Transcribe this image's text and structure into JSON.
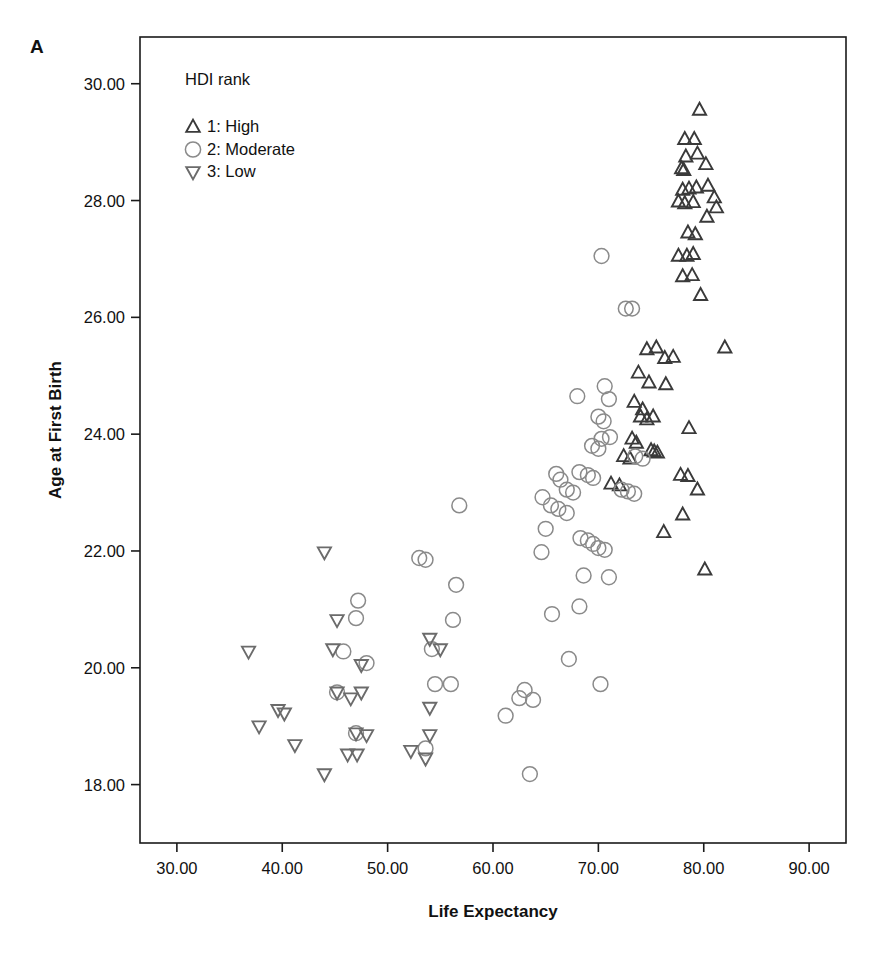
{
  "panel": {
    "label": "A"
  },
  "colors": {
    "high": "#3a3a3a",
    "moderate": "#8a8a8a",
    "low": "#6b6b6b",
    "frame": "#1a1a1a",
    "text": "#111111"
  },
  "legend": {
    "title": "HDI rank",
    "items": [
      {
        "symbol": "triangle-up",
        "label": "1: High"
      },
      {
        "symbol": "circle",
        "label": "2: Moderate"
      },
      {
        "symbol": "triangle-down",
        "label": "3: Low"
      }
    ]
  },
  "chart_data": {
    "type": "scatter",
    "title": "",
    "xlabel": "Life Expectancy",
    "ylabel": "Age at First Birth",
    "xlim": [
      26.5,
      93.5
    ],
    "ylim": [
      17.0,
      30.8
    ],
    "xticks": [
      30,
      40,
      50,
      60,
      70,
      80,
      90
    ],
    "xtick_labels": [
      "30.00",
      "40.00",
      "50.00",
      "60.00",
      "70.00",
      "80.00",
      "90.00"
    ],
    "yticks": [
      18,
      20,
      22,
      24,
      26,
      28,
      30
    ],
    "ytick_labels": [
      "18.00",
      "20.00",
      "22.00",
      "24.00",
      "26.00",
      "28.00",
      "30.00"
    ],
    "grid": false,
    "legend_position": "top-left-inside",
    "series": [
      {
        "name": "1: High",
        "symbol": "triangle-up",
        "color": "#3a3a3a",
        "points": [
          [
            79.6,
            29.55
          ],
          [
            78.2,
            29.05
          ],
          [
            79.1,
            29.05
          ],
          [
            78.3,
            28.75
          ],
          [
            79.4,
            28.8
          ],
          [
            80.2,
            28.62
          ],
          [
            77.9,
            28.55
          ],
          [
            78.1,
            28.52
          ],
          [
            78.0,
            28.18
          ],
          [
            78.6,
            28.2
          ],
          [
            79.3,
            28.22
          ],
          [
            80.4,
            28.25
          ],
          [
            81.0,
            28.05
          ],
          [
            77.6,
            27.98
          ],
          [
            78.2,
            27.95
          ],
          [
            79.0,
            27.97
          ],
          [
            80.3,
            27.72
          ],
          [
            81.2,
            27.88
          ],
          [
            78.5,
            27.45
          ],
          [
            79.2,
            27.42
          ],
          [
            77.6,
            27.05
          ],
          [
            78.4,
            27.05
          ],
          [
            79.0,
            27.08
          ],
          [
            78.0,
            26.7
          ],
          [
            78.9,
            26.72
          ],
          [
            79.7,
            26.38
          ],
          [
            74.6,
            25.45
          ],
          [
            75.5,
            25.48
          ],
          [
            76.3,
            25.3
          ],
          [
            77.1,
            25.32
          ],
          [
            73.8,
            25.05
          ],
          [
            74.8,
            24.88
          ],
          [
            76.4,
            24.85
          ],
          [
            82.0,
            25.48
          ],
          [
            73.4,
            24.55
          ],
          [
            74.2,
            24.42
          ],
          [
            74.0,
            24.3
          ],
          [
            74.6,
            24.25
          ],
          [
            75.2,
            24.3
          ],
          [
            78.6,
            24.1
          ],
          [
            73.2,
            23.92
          ],
          [
            73.6,
            23.85
          ],
          [
            72.4,
            23.62
          ],
          [
            73.0,
            23.58
          ],
          [
            75.0,
            23.72
          ],
          [
            75.3,
            23.7
          ],
          [
            75.6,
            23.68
          ],
          [
            77.8,
            23.3
          ],
          [
            78.5,
            23.28
          ],
          [
            79.4,
            23.05
          ],
          [
            78.0,
            22.62
          ],
          [
            71.2,
            23.15
          ],
          [
            72.0,
            23.12
          ],
          [
            76.2,
            22.32
          ],
          [
            80.1,
            21.68
          ]
        ]
      },
      {
        "name": "2: Moderate",
        "symbol": "circle",
        "color": "#8a8a8a",
        "points": [
          [
            70.3,
            27.05
          ],
          [
            72.6,
            26.15
          ],
          [
            73.2,
            26.15
          ],
          [
            68.0,
            24.65
          ],
          [
            70.6,
            24.82
          ],
          [
            71.0,
            24.6
          ],
          [
            70.0,
            24.3
          ],
          [
            70.5,
            24.22
          ],
          [
            70.3,
            23.92
          ],
          [
            71.1,
            23.95
          ],
          [
            69.4,
            23.8
          ],
          [
            70.0,
            23.75
          ],
          [
            73.5,
            23.62
          ],
          [
            74.2,
            23.58
          ],
          [
            66.0,
            23.32
          ],
          [
            66.4,
            23.22
          ],
          [
            68.2,
            23.35
          ],
          [
            69.0,
            23.3
          ],
          [
            69.5,
            23.25
          ],
          [
            67.0,
            23.05
          ],
          [
            67.6,
            23.0
          ],
          [
            72.2,
            23.05
          ],
          [
            72.8,
            23.02
          ],
          [
            73.4,
            22.98
          ],
          [
            64.7,
            22.92
          ],
          [
            65.5,
            22.78
          ],
          [
            66.2,
            22.72
          ],
          [
            67.0,
            22.65
          ],
          [
            56.8,
            22.78
          ],
          [
            65.0,
            22.38
          ],
          [
            68.3,
            22.22
          ],
          [
            69.0,
            22.18
          ],
          [
            69.5,
            22.12
          ],
          [
            70.0,
            22.05
          ],
          [
            70.6,
            22.02
          ],
          [
            64.6,
            21.98
          ],
          [
            53.0,
            21.88
          ],
          [
            53.6,
            21.85
          ],
          [
            68.6,
            21.58
          ],
          [
            71.0,
            21.55
          ],
          [
            56.5,
            21.42
          ],
          [
            47.2,
            21.15
          ],
          [
            47.0,
            20.85
          ],
          [
            56.2,
            20.82
          ],
          [
            65.6,
            20.92
          ],
          [
            68.2,
            21.05
          ],
          [
            45.8,
            20.28
          ],
          [
            54.2,
            20.32
          ],
          [
            67.2,
            20.15
          ],
          [
            48.0,
            20.08
          ],
          [
            54.5,
            19.72
          ],
          [
            56.0,
            19.72
          ],
          [
            70.2,
            19.72
          ],
          [
            45.2,
            19.58
          ],
          [
            63.0,
            19.62
          ],
          [
            62.5,
            19.48
          ],
          [
            63.8,
            19.45
          ],
          [
            61.2,
            19.18
          ],
          [
            47.0,
            18.88
          ],
          [
            53.6,
            18.62
          ],
          [
            63.5,
            18.18
          ]
        ]
      },
      {
        "name": "3: Low",
        "symbol": "triangle-down",
        "color": "#6b6b6b",
        "points": [
          [
            44.0,
            21.98
          ],
          [
            45.2,
            20.82
          ],
          [
            44.8,
            20.32
          ],
          [
            54.0,
            20.5
          ],
          [
            55.0,
            20.32
          ],
          [
            36.8,
            20.28
          ],
          [
            47.5,
            20.05
          ],
          [
            45.2,
            19.58
          ],
          [
            46.5,
            19.48
          ],
          [
            47.5,
            19.58
          ],
          [
            39.6,
            19.28
          ],
          [
            40.2,
            19.22
          ],
          [
            54.0,
            19.32
          ],
          [
            37.8,
            19.0
          ],
          [
            41.2,
            18.68
          ],
          [
            47.0,
            18.88
          ],
          [
            48.0,
            18.85
          ],
          [
            54.0,
            18.85
          ],
          [
            44.0,
            18.18
          ],
          [
            46.2,
            18.52
          ],
          [
            47.1,
            18.52
          ],
          [
            53.6,
            18.45
          ],
          [
            52.2,
            18.58
          ]
        ]
      }
    ]
  }
}
